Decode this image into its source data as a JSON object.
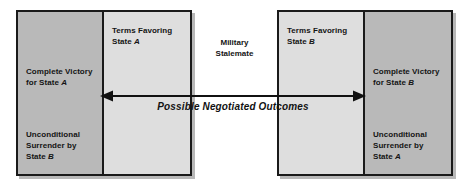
{
  "figure": {
    "type": "bargaining-range-spectrum",
    "background_color": "#ffffff",
    "border_color": "#1a1a1a",
    "panel_dark_color": "#b9b9b9",
    "panel_light_color": "#dedede"
  },
  "left_group": {
    "outer_panel": {
      "line1": "Complete Victory",
      "line2": "for State ",
      "line2_italic": "A",
      "line3": "Unconditional",
      "line4": "Surrender by",
      "line5": "State ",
      "line5_italic": "B"
    },
    "inner_panel": {
      "line1": "Terms Favoring",
      "line2": "State ",
      "line2_italic": "A"
    }
  },
  "center": {
    "line1": "Military",
    "line2": "Stalemate"
  },
  "right_group": {
    "inner_panel": {
      "line1": "Terms Favoring",
      "line2": "State ",
      "line2_italic": "B"
    },
    "outer_panel": {
      "line1": "Complete Victory",
      "line2": "for State ",
      "line2_italic": "B",
      "line3": "Unconditional",
      "line4": "Surrender by",
      "line5": "State ",
      "line5_italic": "A"
    }
  },
  "arrow": {
    "label": "Possible Negotiated Outcomes",
    "direction": "double-headed",
    "color": "#111111"
  }
}
